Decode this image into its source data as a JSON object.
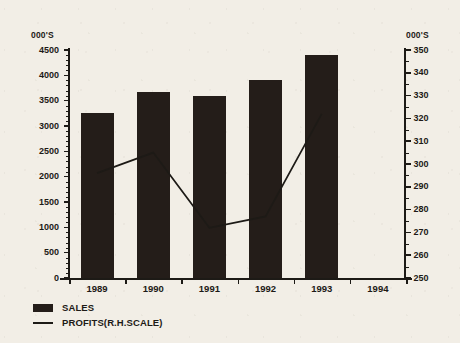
{
  "chart_data": {
    "type": "bar",
    "title": "",
    "xlabel": "",
    "ylabel": "000'S",
    "categories": [
      "1989",
      "1990",
      "1991",
      "1992",
      "1993",
      "1994"
    ],
    "grid": false,
    "legend_position": "bottom-left",
    "left_axis": {
      "unit_label": "000'S",
      "min": 0,
      "max": 4500,
      "step": 500,
      "ticks": [
        "0",
        "500",
        "1000",
        "1500",
        "2000",
        "2500",
        "3000",
        "3500",
        "4000",
        "4500"
      ]
    },
    "right_axis": {
      "unit_label": "000'S",
      "min": 250,
      "max": 350,
      "step": 10,
      "ticks": [
        "250",
        "260",
        "270",
        "280",
        "290",
        "300",
        "310",
        "320",
        "330",
        "340",
        "350"
      ]
    },
    "series": [
      {
        "name": "SALES",
        "type": "bar",
        "axis": "left",
        "color": "#241d19",
        "values": [
          3250,
          3680,
          3600,
          3900,
          4400,
          null
        ]
      },
      {
        "name": "PROFITS(R.H.SCALE)",
        "type": "line",
        "axis": "right",
        "color": "#1d1a16",
        "values": [
          296,
          305,
          272,
          277,
          322,
          null
        ]
      }
    ]
  },
  "legend": {
    "items": [
      {
        "label": "SALES",
        "marker": "filled-square"
      },
      {
        "label": "PROFITS(R.H.SCALE)",
        "marker": "line"
      }
    ]
  }
}
